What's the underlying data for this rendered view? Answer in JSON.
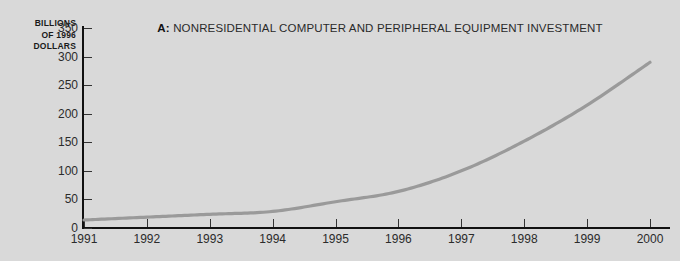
{
  "figure": {
    "background_color": "#d9d9d9",
    "panel_letter": "A:",
    "title": "NONRESIDENTIAL COMPUTER AND PERIPHERAL EQUIPMENT INVESTMENT",
    "y_axis_title_lines": [
      "BILLIONS",
      "OF 1996",
      "DOLLARS"
    ],
    "line_color": "#9a9a9a",
    "axis_color": "#111111"
  },
  "chart_data": {
    "type": "line",
    "title": "A: NONRESIDENTIAL COMPUTER AND PERIPHERAL EQUIPMENT INVESTMENT",
    "xlabel": "",
    "ylabel": "BILLIONS OF 1996 DOLLARS",
    "x": [
      1991,
      1992,
      1993,
      1994,
      1995,
      1996,
      1997,
      1998,
      1999,
      2000
    ],
    "categories": [
      "1991",
      "1992",
      "1993",
      "1994",
      "1995",
      "1996",
      "1997",
      "1998",
      "1999",
      "2000"
    ],
    "values": [
      14,
      19,
      24,
      29,
      46,
      64,
      100,
      152,
      215,
      290
    ],
    "series": [
      {
        "name": "Nonresidential computer and peripheral equipment investment",
        "values": [
          14,
          19,
          24,
          29,
          46,
          64,
          100,
          152,
          215,
          290
        ]
      }
    ],
    "xlim": [
      1991,
      2000
    ],
    "ylim": [
      0,
      350
    ],
    "yticks": [
      0,
      50,
      100,
      150,
      200,
      250,
      300,
      350
    ],
    "ytick_labels": [
      "0",
      "50",
      "100",
      "150",
      "200",
      "250",
      "300",
      "350"
    ],
    "xticks": [
      1991,
      1992,
      1993,
      1994,
      1995,
      1996,
      1997,
      1998,
      1999,
      2000
    ],
    "xtick_labels": [
      "1991",
      "1992",
      "1993",
      "1994",
      "1995",
      "1996",
      "1997",
      "1998",
      "1999",
      "2000"
    ],
    "grid": false,
    "legend": null,
    "legend_position": "none"
  }
}
